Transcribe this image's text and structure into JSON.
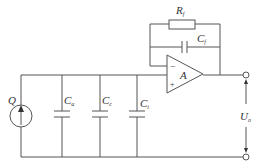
{
  "diagram": {
    "type": "charge amplifier equivalent circuit",
    "components": {
      "source": {
        "label": "Q",
        "kind": "charge-source"
      },
      "cap_a": {
        "label": "C",
        "sub": "a"
      },
      "cap_c": {
        "label": "C",
        "sub": "c"
      },
      "cap_i": {
        "label": "C",
        "sub": "i"
      },
      "feedback_resistor": {
        "label": "R",
        "sub": "f"
      },
      "feedback_capacitor": {
        "label": "C",
        "sub": "f"
      },
      "opamp": {
        "label": "A",
        "minus": "−",
        "plus": "+"
      },
      "output": {
        "label": "U",
        "sub": "o"
      }
    },
    "colors": {
      "line": "#555555",
      "text": "#333333",
      "background": "#ffffff"
    }
  }
}
